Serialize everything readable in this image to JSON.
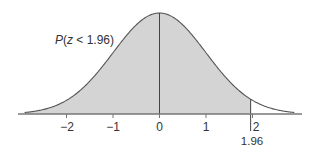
{
  "chart_data": {
    "type": "area",
    "title": "",
    "subtitle": "",
    "xlabel": "",
    "ylabel": "",
    "distribution": "standard normal",
    "x_ticks": [
      -2,
      -1,
      0,
      1,
      2
    ],
    "x_tick_labels": [
      "−2",
      "−1",
      "0",
      "1",
      "2"
    ],
    "xlim": [
      -2.9,
      2.9
    ],
    "grid": false,
    "legend": null,
    "shaded_region": {
      "from": -2.9,
      "to": 1.96
    },
    "markers": [
      {
        "x": 0,
        "type": "vertical-line",
        "label": ""
      },
      {
        "x": 1.96,
        "type": "vertical-line",
        "label": "1.96"
      }
    ],
    "annotations": [
      {
        "text": "P(z < 1.96)",
        "position": "upper-left of curve"
      }
    ],
    "colors": {
      "fill": "#d4d4d4",
      "line": "#555555"
    }
  },
  "labels": {
    "annotation": "P(z < 1.96)",
    "annotation_parts": {
      "p": "P",
      "open": "(",
      "z": "z",
      "rest": " < 1.96)"
    },
    "tick_minus2": "−2",
    "tick_minus1": "−1",
    "tick_0": "0",
    "tick_1": "1",
    "tick_2": "2",
    "marker_value": "1.96"
  }
}
